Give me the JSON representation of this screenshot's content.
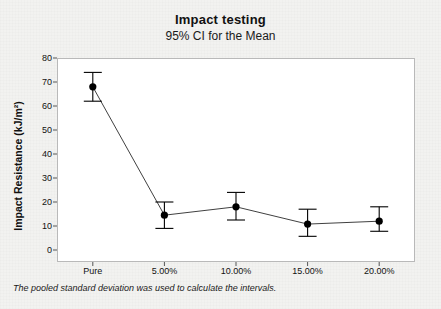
{
  "chart_data": {
    "type": "line",
    "title": "Impact testing",
    "subtitle": "95% CI for the Mean",
    "xlabel": "",
    "ylabel": "Impact Resistance (kJ/m²)",
    "categories": [
      "Pure",
      "5.00%",
      "10.00%",
      "15.00%",
      "20.00%"
    ],
    "values": [
      68,
      14.5,
      18,
      10.8,
      12
    ],
    "ci_lower": [
      62,
      9,
      12.5,
      5.7,
      7.8
    ],
    "ci_upper": [
      74,
      20,
      24,
      17,
      18
    ],
    "ylim": [
      0,
      80
    ],
    "yticks": [
      0,
      10,
      20,
      30,
      40,
      50,
      60,
      70,
      80
    ],
    "ytick_labels": [
      "0",
      "10",
      "20",
      "30",
      "40",
      "50",
      "60",
      "70",
      "80"
    ],
    "grid": false,
    "legend": "none",
    "annotation": "The pooled standard deviation was used to calculate the intervals.",
    "marker": "filled-circle",
    "errorbar": "capped-vertical",
    "series_color": "#000000",
    "plot_background": "#ffffff",
    "figure_background": "#f2f2f0"
  }
}
